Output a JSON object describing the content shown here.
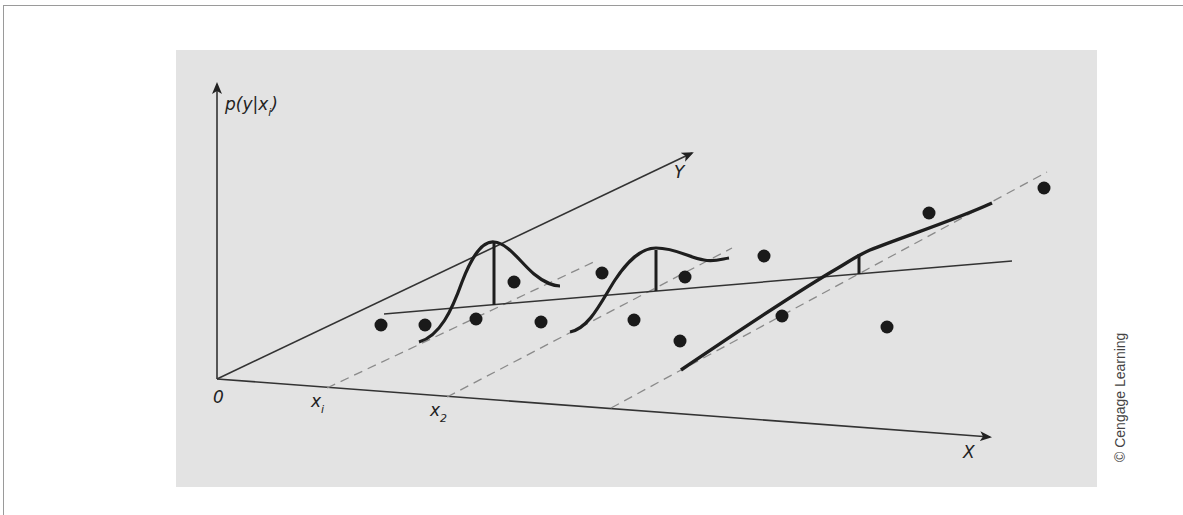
{
  "figure": {
    "vertical_axis_label": "p(y|x",
    "vertical_axis_label_sub": "i",
    "vertical_axis_label_close": ")",
    "y_axis_label": "Y",
    "x_axis_label": "X",
    "origin_label": "0",
    "x_ticks": [
      {
        "base": "x",
        "sub": "i"
      },
      {
        "base": "x",
        "sub": "2"
      }
    ],
    "credit": "© Cengage Learning"
  },
  "colors": {
    "panel": "#e3e3e3",
    "ink": "#222222",
    "dashed": "#8a8a8a"
  }
}
